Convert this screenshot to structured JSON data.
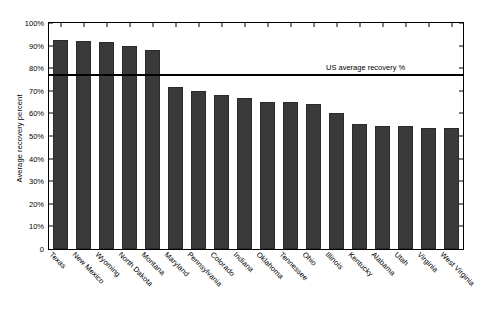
{
  "chart_data": {
    "type": "bar",
    "title": "",
    "subtitle": "",
    "xlabel": "",
    "ylabel": "Average recovery percent",
    "ylim": [
      0,
      100
    ],
    "ytick_labels": [
      "0",
      "10%",
      "20%",
      "30%",
      "40%",
      "50%",
      "60%",
      "70%",
      "80%",
      "90%",
      "100%"
    ],
    "ytick_values": [
      0,
      10,
      20,
      30,
      40,
      50,
      60,
      70,
      80,
      90,
      100
    ],
    "grid": false,
    "legend_position": "none",
    "bar_color": "#3a3a3a",
    "categories": [
      "Texas",
      "New Mexico",
      "Wyoming",
      "North Dakota",
      "Montana",
      "Maryland",
      "Pennsylvania",
      "Colorado",
      "Indiana",
      "Oklahoma",
      "Tennessee",
      "Ohio",
      "Illinois",
      "Kentucky",
      "Alabama",
      "Utah",
      "Virginia",
      "West Virginia"
    ],
    "values": [
      92.5,
      92.0,
      91.5,
      90.0,
      88.0,
      71.5,
      70.0,
      68.0,
      67.0,
      65.0,
      65.0,
      64.0,
      60.0,
      55.5,
      54.5,
      54.5,
      53.5,
      53.5
    ],
    "annotations": [
      {
        "name": "us-average-line",
        "label": "US average recovery %",
        "value": 77.0,
        "orientation": "horizontal",
        "color": "#000000"
      }
    ]
  }
}
